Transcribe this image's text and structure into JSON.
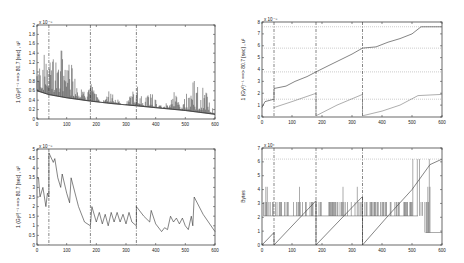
{
  "chart_data": [
    {
      "id": "top-left",
      "type": "line",
      "title": "",
      "xlabel": "",
      "ylabel": "1 (Gy²)⁻¹ ==> 80.7 [sec] , u²",
      "y_exponent_label": "x 10⁻⁸",
      "xlim": [
        0,
        600
      ],
      "ylim": [
        0,
        2
      ],
      "xticks": [
        "0",
        "100",
        "200",
        "300",
        "400",
        "500",
        "600"
      ],
      "yticks": [
        "0",
        "0.2",
        "0.4",
        "0.6",
        "0.8",
        "1",
        "1.2",
        "1.4",
        "1.6",
        "1.8",
        "2"
      ],
      "vlines": [
        40,
        180,
        335
      ],
      "grid": false,
      "description": "Decaying baseline from ~0.6 to ~0.1 with dense vertical spikes; major spikes near x=40 (1.9), 60 (1.5), 80 (1.6), 110 (1.5), increasing spike activity near 520-560 (up to 0.95)",
      "series": [
        {
          "name": "baseline",
          "x": [
            0,
            40,
            100,
            180,
            250,
            335,
            400,
            500,
            600
          ],
          "y": [
            0.6,
            0.52,
            0.45,
            0.38,
            0.33,
            0.28,
            0.24,
            0.18,
            0.1
          ]
        },
        {
          "name": "spikes",
          "x": [
            10,
            40,
            60,
            80,
            110,
            140,
            180,
            250,
            335,
            385,
            460,
            525,
            560
          ],
          "y": [
            1.3,
            1.9,
            1.5,
            1.6,
            1.5,
            0.9,
            0.8,
            0.7,
            0.8,
            0.65,
            0.6,
            0.95,
            0.75
          ]
        }
      ]
    },
    {
      "id": "top-right",
      "type": "line",
      "title": "",
      "xlabel": "",
      "ylabel": "1 (Gy²)⁻¹ ==> 80.7 [sec] , u²",
      "y_exponent_label": "x 10⁻⁸",
      "xlim": [
        0,
        600
      ],
      "ylim": [
        0,
        8
      ],
      "xticks": [
        "0",
        "100",
        "200",
        "300",
        "400",
        "500",
        "600"
      ],
      "yticks": [
        "0",
        "1",
        "2",
        "3",
        "4",
        "5",
        "6",
        "7",
        "8"
      ],
      "vlines": [
        40,
        180,
        335
      ],
      "hlines": [
        1.5,
        3.8,
        5.8,
        7.6
      ],
      "grid": false,
      "series": [
        {
          "name": "cumulative",
          "x": [
            0,
            10,
            40,
            40,
            80,
            110,
            150,
            180,
            220,
            260,
            300,
            335,
            380,
            420,
            460,
            500,
            530,
            600
          ],
          "y": [
            0.8,
            1.3,
            1.5,
            2.4,
            2.6,
            3.0,
            3.4,
            3.8,
            4.3,
            4.8,
            5.3,
            5.8,
            5.9,
            6.3,
            6.6,
            7.0,
            7.6,
            7.6
          ]
        },
        {
          "name": "reset-segments",
          "x": [
            40,
            100,
            180,
            180,
            250,
            335,
            335,
            400,
            460,
            520,
            600
          ],
          "y": [
            0.8,
            1.3,
            2.0,
            0.1,
            1.0,
            1.9,
            0.1,
            0.5,
            1.0,
            1.8,
            1.9
          ]
        }
      ]
    },
    {
      "id": "bottom-left",
      "type": "line",
      "title": "",
      "xlabel": "",
      "ylabel": "1 (Gy²)⁻¹ ==> 80.7 [sec] , u²",
      "y_exponent_label": "x 10⁻⁸",
      "xlim": [
        0,
        600
      ],
      "ylim": [
        0,
        5
      ],
      "xticks": [
        "0",
        "100",
        "200",
        "300",
        "400",
        "500",
        "600"
      ],
      "yticks": [
        "0",
        "0.5",
        "1",
        "1.5",
        "2",
        "2.5",
        "3",
        "3.5",
        "4",
        "4.5",
        "5"
      ],
      "vlines": [
        40,
        180,
        335
      ],
      "grid": false,
      "series": [
        {
          "name": "variance",
          "x": [
            0,
            5,
            10,
            20,
            30,
            35,
            40,
            40,
            55,
            60,
            70,
            80,
            85,
            100,
            110,
            115,
            140,
            160,
            180,
            185,
            200,
            210,
            220,
            230,
            240,
            250,
            260,
            270,
            280,
            290,
            300,
            310,
            320,
            335,
            335,
            360,
            380,
            385,
            400,
            420,
            430,
            440,
            450,
            460,
            470,
            480,
            490,
            500,
            510,
            520,
            525,
            530,
            560,
            600
          ],
          "y": [
            3.5,
            3.5,
            2.5,
            3.0,
            2.0,
            2.7,
            2.5,
            4.8,
            4.3,
            4.5,
            3.5,
            3.0,
            3.7,
            2.7,
            2.2,
            3.5,
            2.0,
            1.2,
            1.0,
            2.0,
            1.2,
            1.7,
            1.1,
            1.6,
            1.0,
            1.7,
            1.2,
            1.7,
            1.2,
            1.6,
            1.1,
            1.7,
            1.2,
            1.0,
            2.0,
            1.5,
            1.2,
            1.8,
            1.1,
            0.7,
            0.9,
            0.8,
            1.5,
            1.2,
            1.4,
            1.1,
            1.4,
            1.0,
            0.8,
            1.5,
            1.0,
            2.5,
            1.6,
            0.7
          ]
        }
      ]
    },
    {
      "id": "bottom-right",
      "type": "line",
      "title": "",
      "xlabel": "",
      "ylabel": "Bytes",
      "y_exponent_label": "x 10⁴",
      "xlim": [
        0,
        600
      ],
      "ylim": [
        0,
        7
      ],
      "xticks": [
        "0",
        "100",
        "200",
        "300",
        "400",
        "500",
        "600"
      ],
      "yticks": [
        "0",
        "1",
        "2",
        "3",
        "4",
        "5",
        "6",
        "7"
      ],
      "vlines": [
        40,
        180,
        335
      ],
      "hlines": [
        6.2
      ],
      "grid": false,
      "series": [
        {
          "name": "packet-size",
          "description": "Rapid oscillation between ~2.1 and ~3.1 with spikes to ~4.2; rises to ~6.2 near 520-570, then drops to ~0.9",
          "levels": [
            2.1,
            3.1
          ],
          "spike_level": 4.2
        },
        {
          "name": "cumulative-bytes",
          "x": [
            0,
            40,
            40,
            180,
            180,
            335,
            335,
            420,
            500,
            560,
            600
          ],
          "y": [
            0,
            0.9,
            0,
            3.2,
            0,
            3.5,
            0,
            2.1,
            4.0,
            5.8,
            6.2
          ]
        }
      ]
    }
  ]
}
